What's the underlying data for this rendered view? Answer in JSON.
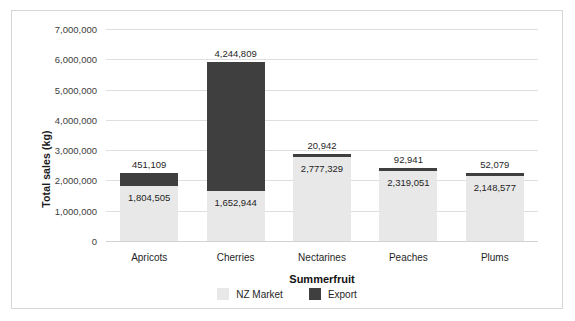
{
  "chart_data": {
    "type": "bar",
    "subtype": "stacked-column",
    "title": "",
    "xlabel": "Summerfruit",
    "ylabel": "Total sales (kg)",
    "categories": [
      "Apricots",
      "Cherries",
      "Nectarines",
      "Peaches",
      "Plums"
    ],
    "series": [
      {
        "name": "NZ Market",
        "color": "#e8e8e8",
        "values": [
          1804505,
          1652944,
          2777329,
          2319051,
          2148577
        ],
        "labels": [
          "1,804,505",
          "1,652,944",
          "2,777,329",
          "2,319,051",
          "2,148,577"
        ]
      },
      {
        "name": "Export",
        "color": "#3f3f3f",
        "values": [
          451109,
          4244809,
          20942,
          92941,
          52079
        ],
        "labels": [
          "451,109",
          "4,244,809",
          "20,942",
          "92,941",
          "52,079"
        ]
      }
    ],
    "ylim": [
      0,
      7000000
    ],
    "ytick_values": [
      0,
      1000000,
      2000000,
      3000000,
      4000000,
      5000000,
      6000000,
      7000000
    ],
    "ytick_labels": [
      "0",
      "1,000,000",
      "2,000,000",
      "3,000,000",
      "4,000,000",
      "5,000,000",
      "6,000,000",
      "7,000,000"
    ],
    "grid": true,
    "legend_position": "bottom"
  },
  "axes": {
    "y_title": "Total sales (kg)",
    "x_title": "Summerfruit"
  },
  "legend": {
    "items": [
      {
        "label": "NZ Market",
        "color": "#e8e8e8"
      },
      {
        "label": "Export",
        "color": "#3f3f3f"
      }
    ]
  }
}
